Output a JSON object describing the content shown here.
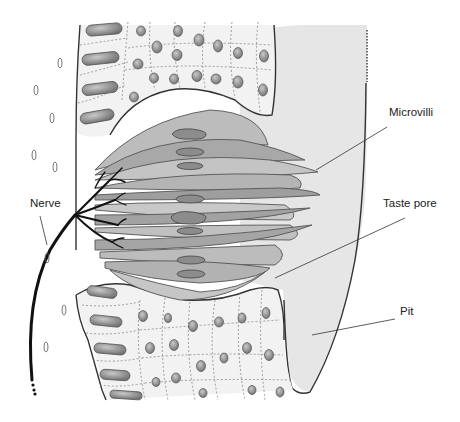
{
  "diagram": {
    "labels": [
      {
        "id": "microvilli",
        "text": "Microvilli",
        "x": 389,
        "y": 106,
        "pointer": [
          [
            387,
            127
          ],
          [
            316,
            170
          ]
        ]
      },
      {
        "id": "taste-pore",
        "text": "Taste pore",
        "x": 383,
        "y": 197,
        "pointer": [
          [
            405,
            218
          ],
          [
            275,
            278
          ]
        ]
      },
      {
        "id": "pit",
        "text": "Pit",
        "x": 400,
        "y": 311,
        "pointer": [
          [
            395,
            319
          ],
          [
            312,
            335
          ]
        ]
      },
      {
        "id": "nerve",
        "text": "Nerve",
        "x": 30,
        "y": 200,
        "pointer": [
          [
            40,
            216
          ],
          [
            47,
            245
          ]
        ]
      }
    ],
    "colors": {
      "background": "#ffffff",
      "pit_fill": "#e6e6e6",
      "epithelium_fill": "#f1f1f1",
      "cell_nucleus": "#8a8a8a",
      "taste_cell_light": "#bdbdbd",
      "taste_cell_dark": "#9a9a9a",
      "outline": "#333333",
      "nerve": "#111111"
    }
  }
}
